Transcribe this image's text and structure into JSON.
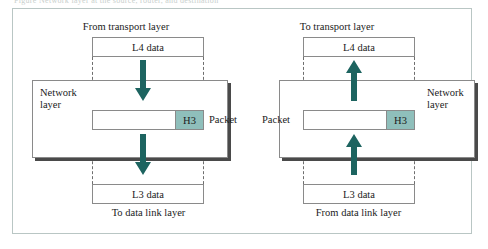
{
  "figure": {
    "top_caption": "Figure  Network layer at the source, router, and destination",
    "colors": {
      "arrow": "#1d6460",
      "header_fill": "#8fbfbb",
      "box_border": "#8a8a8a",
      "frame_border": "#b9c6c4",
      "shadow": "#4a4a4a",
      "background": "#ffffff"
    }
  },
  "left_panel": {
    "top_caption": "From transport layer",
    "upper_box_label": "L4 data",
    "layer_label_line1": "Network",
    "layer_label_line2": "layer",
    "packet_header": "H3",
    "packet_label": "Packet",
    "lower_box_label": "L3 data",
    "bottom_caption": "To data link layer",
    "arrow_direction": "down"
  },
  "right_panel": {
    "top_caption": "To transport layer",
    "upper_box_label": "L4 data",
    "layer_label_line1": "Network",
    "layer_label_line2": "layer",
    "packet_header": "H3",
    "packet_label": "Packet",
    "lower_box_label": "L3 data",
    "bottom_caption": "From data link layer",
    "arrow_direction": "up"
  }
}
